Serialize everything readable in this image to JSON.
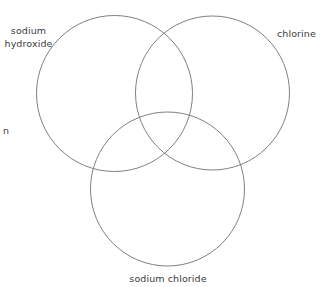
{
  "diagram": {
    "type": "venn-3-circle",
    "background_color": "#ffffff",
    "stroke_color": "#808080",
    "stroke_width": 1,
    "text_color": "#3b3b3b",
    "circles": [
      {
        "id": "sodium-hydroxide",
        "label": "sodium\nhydroxide",
        "label_line_1": "sodium",
        "label_line_2": "hydroxide",
        "cx": 114.5,
        "cy": 93.5,
        "r": 78
      },
      {
        "id": "chlorine",
        "label": "chlorine",
        "cx": 212.5,
        "cy": 93,
        "r": 77
      },
      {
        "id": "sodium-chloride",
        "label": "sodium chloride",
        "cx": 167.5,
        "cy": 189,
        "r": 77
      }
    ],
    "clipped_text": {
      "id": "left-edge-fragment",
      "text": "n"
    }
  }
}
